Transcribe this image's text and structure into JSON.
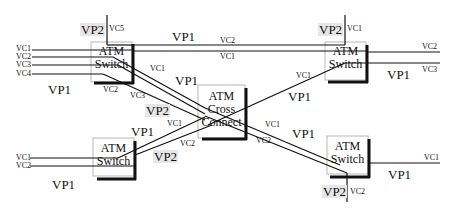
{
  "diagram": {
    "nodes": [
      {
        "id": "switch_tl",
        "label_line1": "ATM",
        "label_line2": "Switch"
      },
      {
        "id": "switch_tr",
        "label_line1": "ATM",
        "label_line2": "Switch"
      },
      {
        "id": "switch_bl",
        "label_line1": "ATM",
        "label_line2": "Switch"
      },
      {
        "id": "switch_br",
        "label_line1": "ATM",
        "label_line2": "Switch"
      },
      {
        "id": "cross_connect",
        "label_line1": "ATM",
        "label_line2": "Cross",
        "label_line3": "Connect"
      }
    ],
    "labels": {
      "tl_inputs": [
        "VC1",
        "VC2",
        "VC3",
        "VC4"
      ],
      "tl_vp_in": "VP1",
      "tl_vp2": "VP2",
      "tl_vc5": "VC5",
      "top_vp1": "VP1",
      "top_vc2": "VC2",
      "top_vc1": "VC1",
      "tl_out_vc1": "VC1",
      "tl_out_vp1": "VP1",
      "tl_out_vc2": "VC2",
      "tl_out_vc3": "VC3",
      "mid_vp2": "VP2",
      "tr_vp2": "VP2",
      "tr_vc1": "VC1",
      "tr_out_vc2": "VC2",
      "tr_out_vc3": "VC3",
      "tr_out_vp1": "VP1",
      "cc_tr_vc1": "VC1",
      "cc_tr_vp1": "VP1",
      "bl_inputs": [
        "VC1",
        "VC2"
      ],
      "bl_vp_in": "VP1",
      "bl_vp1": "VP1",
      "bl_vp2": "VP2",
      "cc_bl_vc1": "VC1",
      "cc_bl_vc2": "VC2",
      "cc_br_vc1": "VC1",
      "cc_br_vc2": "VC2",
      "cc_br_vp1": "VP1",
      "br_out_vc1": "VC1",
      "br_out_vp1": "VP1",
      "br_vp2": "VP2",
      "br_vc2": "VC2"
    }
  }
}
